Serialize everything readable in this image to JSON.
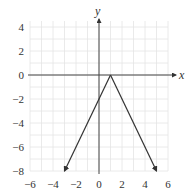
{
  "chart_data": {
    "type": "line",
    "title": "",
    "xlabel": "x",
    "ylabel": "y",
    "xlim": [
      -6,
      6
    ],
    "ylim": [
      -8,
      4
    ],
    "grid": true,
    "x_ticks": [
      -6,
      -4,
      -2,
      0,
      2,
      4,
      6
    ],
    "y_ticks": [
      4,
      2,
      0,
      -2,
      -4,
      -6,
      -8
    ],
    "x_tick_labels": [
      "−6",
      "−4",
      "−2",
      "0",
      "2",
      "4",
      "6"
    ],
    "y_tick_labels": [
      "4",
      "2",
      "0",
      "−2",
      "−4",
      "−6",
      "−8"
    ],
    "series": [
      {
        "name": "y = -2|x - 1|",
        "x": [
          -3,
          0,
          1,
          5
        ],
        "y": [
          -8,
          -2,
          0,
          -8
        ],
        "vertex": [
          1,
          0
        ],
        "arrows_at_ends": true
      }
    ],
    "colors": {
      "axis": "#444444",
      "grid": "#e4e4e4",
      "line": "#333333",
      "text": "#333333"
    }
  }
}
